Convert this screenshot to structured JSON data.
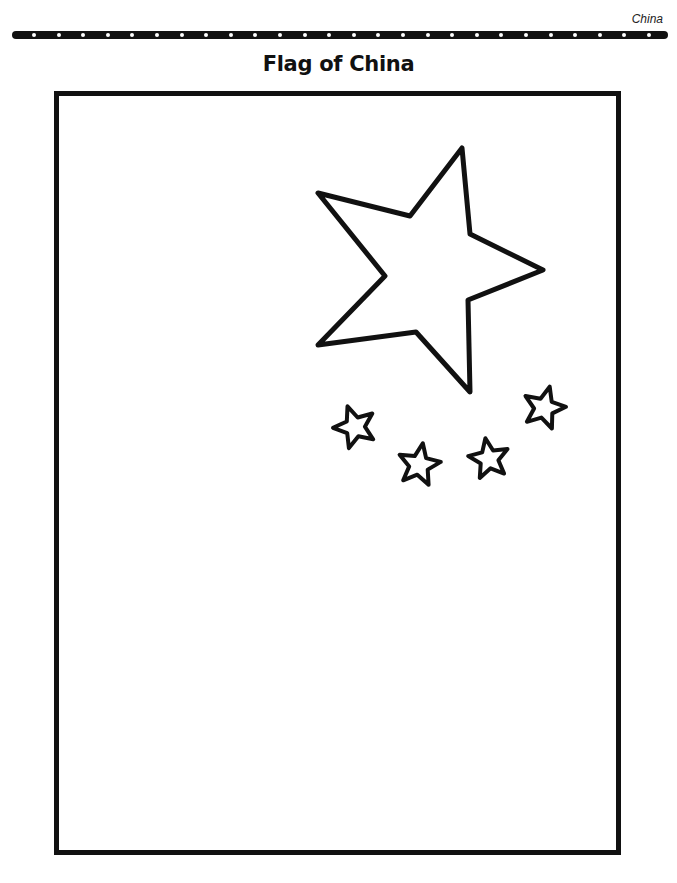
{
  "header": {
    "section_label": "China",
    "dot_count": 26
  },
  "title": "Flag of China",
  "flag": {
    "large_star": {
      "points": "318,193 410,216 462,148 470,234 543,270 468,300 470,392 416,332 318,345 385,276"
    },
    "small_stars": [
      {
        "name": "small-star-1",
        "cx": 355,
        "cy": 427,
        "r": 22,
        "rotation": -20
      },
      {
        "name": "small-star-2",
        "cx": 419,
        "cy": 465,
        "r": 22,
        "rotation": 10
      },
      {
        "name": "small-star-3",
        "cx": 489,
        "cy": 459,
        "r": 21,
        "rotation": -10
      },
      {
        "name": "small-star-4",
        "cx": 544,
        "cy": 408,
        "r": 22,
        "rotation": 15
      }
    ],
    "stroke_color": "#111111",
    "fill_color": "#ffffff"
  }
}
